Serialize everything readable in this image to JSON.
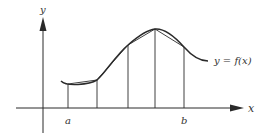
{
  "figure": {
    "type": "trapezoidal-approximation",
    "axes": {
      "x_label": "x",
      "y_label": "y"
    },
    "curve_label": "y = f(x)",
    "interval": {
      "start_label": "a",
      "end_label": "b"
    },
    "partition_count": 4,
    "colors": {
      "ink": "#2a2a2a",
      "background": "#ffffff"
    }
  }
}
